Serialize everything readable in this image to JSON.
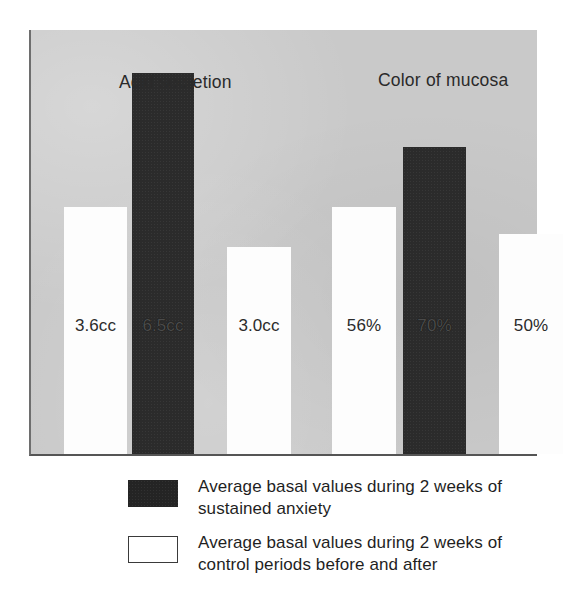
{
  "figure": {
    "background_color": "#ffffff",
    "panel_color": "#c9c9c9",
    "dark_color": "#2b2b2b",
    "light_color": "#fdfdfd"
  },
  "groups": [
    {
      "title": "Acid secretion"
    },
    {
      "title": "Color of mucosa"
    }
  ],
  "bars": [
    {
      "label": "3.6cc",
      "series": "control",
      "style": "light",
      "left": 33,
      "width": 63,
      "height": 247
    },
    {
      "label": "6.5cc",
      "series": "anxiety",
      "style": "dark",
      "left": 101,
      "width": 62,
      "height": 381
    },
    {
      "label": "3.0cc",
      "series": "control",
      "style": "light",
      "left": 196,
      "width": 64,
      "height": 207
    },
    {
      "label": "56%",
      "series": "control",
      "style": "light",
      "left": 301,
      "width": 64,
      "height": 247
    },
    {
      "label": "70%",
      "series": "anxiety",
      "style": "dark",
      "left": 372,
      "width": 63,
      "height": 307
    },
    {
      "label": "50%",
      "series": "control",
      "style": "light",
      "left": 468,
      "width": 64,
      "height": 220
    }
  ],
  "legend": [
    {
      "swatch": "dark",
      "line1": "Average basal values during 2 weeks of",
      "line2": "sustained anxiety"
    },
    {
      "swatch": "light",
      "line1": "Average basal values during 2 weeks of",
      "line2": "control periods before and after"
    }
  ],
  "chart_data": {
    "type": "bar",
    "title": "",
    "subtitle": "",
    "xlabel": "",
    "ylabel": "",
    "grid": false,
    "legend_position": "bottom",
    "groups": [
      "Acid secretion",
      "Color of mucosa"
    ],
    "categories": [
      "Acid secretion — control (before)",
      "Acid secretion — sustained anxiety",
      "Acid secretion — control (after)",
      "Color of mucosa — control (before)",
      "Color of mucosa — sustained anxiety",
      "Color of mucosa — control (after)"
    ],
    "values": [
      3.6,
      6.5,
      3.0,
      56,
      70,
      50
    ],
    "value_labels": [
      "3.6cc",
      "6.5cc",
      "3.0cc",
      "56%",
      "70%",
      "50%"
    ],
    "units": [
      "cc",
      "cc",
      "cc",
      "%",
      "%",
      "%"
    ],
    "series": [
      {
        "name": "Average basal values during 2 weeks of sustained anxiety",
        "color": "#2b2b2b",
        "points": [
          {
            "group": "Acid secretion",
            "value": 6.5,
            "label": "6.5cc"
          },
          {
            "group": "Color of mucosa",
            "value": 70,
            "label": "70%"
          }
        ]
      },
      {
        "name": "Average basal values during 2 weeks of control periods before and after",
        "color": "#fdfdfd",
        "points": [
          {
            "group": "Acid secretion",
            "value": 3.6,
            "label": "3.6cc",
            "period": "before"
          },
          {
            "group": "Acid secretion",
            "value": 3.0,
            "label": "3.0cc",
            "period": "after"
          },
          {
            "group": "Color of mucosa",
            "value": 56,
            "label": "56%",
            "period": "before"
          },
          {
            "group": "Color of mucosa",
            "value": 50,
            "label": "50%",
            "period": "after"
          }
        ]
      }
    ]
  }
}
